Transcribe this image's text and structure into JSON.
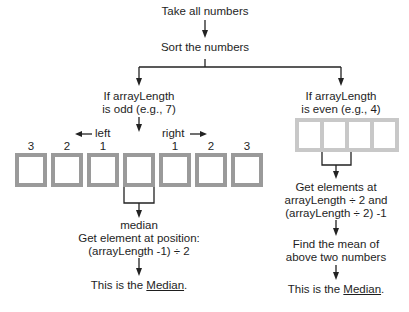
{
  "top": {
    "step1": "Take all numbers",
    "step2": "Sort the numbers"
  },
  "odd_branch": {
    "condition_line1": "If arrayLength",
    "condition_line2": "is odd (e.g., 7)",
    "left_label": "left",
    "right_label": "right",
    "index_labels": [
      "3",
      "2",
      "1",
      "",
      "1",
      "2",
      "3"
    ],
    "box_count": 7,
    "median_label": "median",
    "rule_line1": "Get element at position:",
    "rule_line2": "(arrayLength -1) ÷ 2",
    "result_prefix": "This is the ",
    "result_word": "Median",
    "result_suffix": "."
  },
  "even_branch": {
    "condition_line1": "If arrayLength",
    "condition_line2": "is even (e.g., 4)",
    "box_count": 4,
    "rule_line1": "Get elements at",
    "rule_line2": "arrayLength ÷ 2 and",
    "rule_line3": "(arrayLength ÷ 2) -1",
    "mean_line1": "Find the mean of",
    "mean_line2": "above two numbers",
    "result_prefix": "This is the ",
    "result_word": "Median",
    "result_suffix": "."
  },
  "colors": {
    "line": "#222222",
    "odd_box": "#9a9a9a",
    "even_box": "#c8c8c8"
  }
}
